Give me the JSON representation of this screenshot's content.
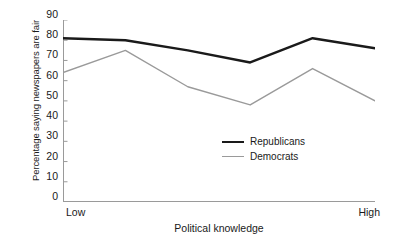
{
  "chart_data": {
    "type": "line",
    "title": "",
    "subtitle": "",
    "xlabel": "Political knowledge",
    "ylabel": "Percentage saying newspapers are fair",
    "x": [
      1,
      2,
      3,
      4,
      5,
      6
    ],
    "xtick_labels": [
      "Low",
      "",
      "",
      "",
      "",
      "High"
    ],
    "x_endpoint_low": "Low",
    "x_endpoint_high": "High",
    "ylim": [
      0,
      90
    ],
    "ytick_labels": [
      "90",
      "80",
      "70",
      "60",
      "50",
      "40",
      "30",
      "20",
      "10",
      "0"
    ],
    "ytick_values": [
      90,
      80,
      70,
      60,
      50,
      40,
      30,
      20,
      10,
      0
    ],
    "ytick_step": 10,
    "grid": false,
    "legend_position": "inside-lower-right",
    "series": [
      {
        "name": "Republicans",
        "values": [
          81,
          80,
          75,
          69,
          81,
          76
        ],
        "color": "#1a1a1a",
        "line_width": 2.4
      },
      {
        "name": "Democrats",
        "values": [
          64,
          75,
          57,
          48,
          66,
          50
        ],
        "color": "#9a9a9a",
        "line_width": 1.4
      }
    ],
    "annotations": [],
    "axis_color": "#9a9a9a"
  },
  "legend": {
    "items": [
      {
        "label": "Republicans",
        "color": "#1a1a1a"
      },
      {
        "label": "Democrats",
        "color": "#9a9a9a"
      }
    ]
  }
}
